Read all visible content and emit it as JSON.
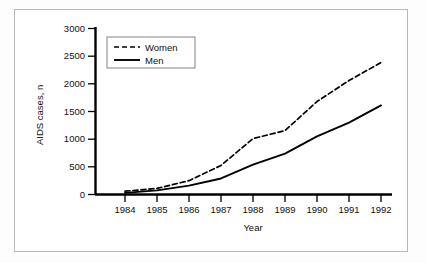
{
  "figure": {
    "frame_color": "#b9b9b9",
    "background": "#ffffff",
    "ink_color": "#000000"
  },
  "chart_data": {
    "type": "line",
    "title": "",
    "xlabel": "Year",
    "ylabel": "AIDS cases, n",
    "categories": [
      "1984",
      "1985",
      "1986",
      "1987",
      "1988",
      "1989",
      "1990",
      "1991",
      "1992"
    ],
    "x": [
      1984,
      1985,
      1986,
      1987,
      1988,
      1989,
      1990,
      1991,
      1992
    ],
    "series": [
      {
        "name": "Women",
        "style": "dashed",
        "color": "#000000",
        "values": [
          60,
          110,
          250,
          525,
          1010,
          1155,
          1680,
          2060,
          2385
        ]
      },
      {
        "name": "Men",
        "style": "solid",
        "color": "#000000",
        "values": [
          30,
          75,
          160,
          290,
          540,
          740,
          1050,
          1300,
          1610
        ]
      }
    ],
    "xlim": [
      1983.6,
      1992.4
    ],
    "ylim": [
      0,
      3000
    ],
    "yticks": [
      0,
      500,
      1000,
      1500,
      2000,
      2500,
      3000
    ],
    "ytick_labels": [
      "0",
      "500",
      "1000",
      "1500",
      "2000",
      "2500",
      "3000"
    ],
    "xtick_labels": [
      "1984",
      "1985",
      "1986",
      "1987",
      "1988",
      "1989",
      "1990",
      "1991",
      "1992"
    ],
    "grid": false,
    "legend_position": "top-left",
    "legend_entries": [
      {
        "label": "Women",
        "style": "dashed"
      },
      {
        "label": "Men",
        "style": "solid"
      }
    ]
  }
}
